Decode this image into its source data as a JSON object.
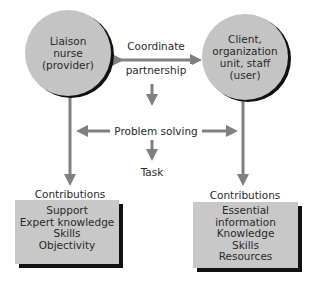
{
  "diagram": {
    "left_node": {
      "lines": [
        "Liaison",
        "nurse",
        "(provider)"
      ]
    },
    "right_node": {
      "lines": [
        "Client,",
        "organization",
        "unit, staff",
        "(user)"
      ]
    },
    "top_label": {
      "line1": "Coordinate",
      "line2": "partnership"
    },
    "middle_label": "Problem solving",
    "bottom_label": "Task",
    "left_contributions": {
      "title": "Contributions",
      "items": [
        "Support",
        "Expert knowledge",
        "Skills",
        "Objectivity"
      ]
    },
    "right_contributions": {
      "title": "Contributions",
      "items": [
        "Essential",
        "information",
        "Knowledge",
        "Skills",
        "Resources"
      ]
    },
    "colors": {
      "node_fill": "#c4c4c4",
      "arrow": "#808080",
      "shadow": "#111111",
      "box_fill": "#c8c8c8"
    }
  }
}
